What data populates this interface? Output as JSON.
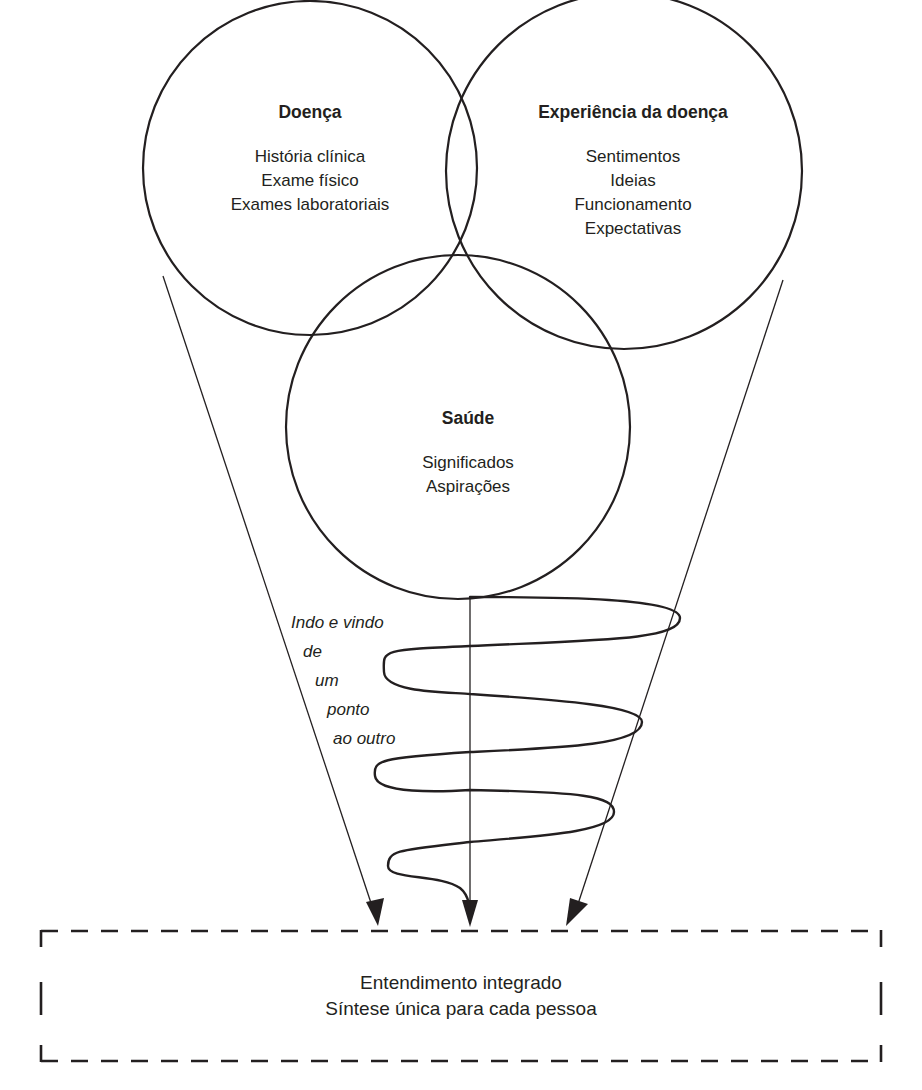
{
  "diagram": {
    "circles": [
      {
        "id": "doenca",
        "title": "Doença",
        "items": [
          "História clínica",
          "Exame físico",
          "Exames laboratoriais"
        ]
      },
      {
        "id": "experiencia",
        "title": "Experiência da doença",
        "items": [
          "Sentimentos",
          "Ideias",
          "Funcionamento",
          "Expectativas"
        ]
      },
      {
        "id": "saude",
        "title": "Saúde",
        "items": [
          "Significados",
          "Aspirações"
        ]
      }
    ],
    "spiral_note": [
      "Indo e vindo",
      "de",
      "um",
      "ponto",
      "ao outro"
    ],
    "result_box": {
      "lines": [
        "Entendimento integrado",
        "Síntese única para cada pessoa"
      ]
    },
    "stroke_color": "#231f20",
    "background_color": "#ffffff"
  }
}
